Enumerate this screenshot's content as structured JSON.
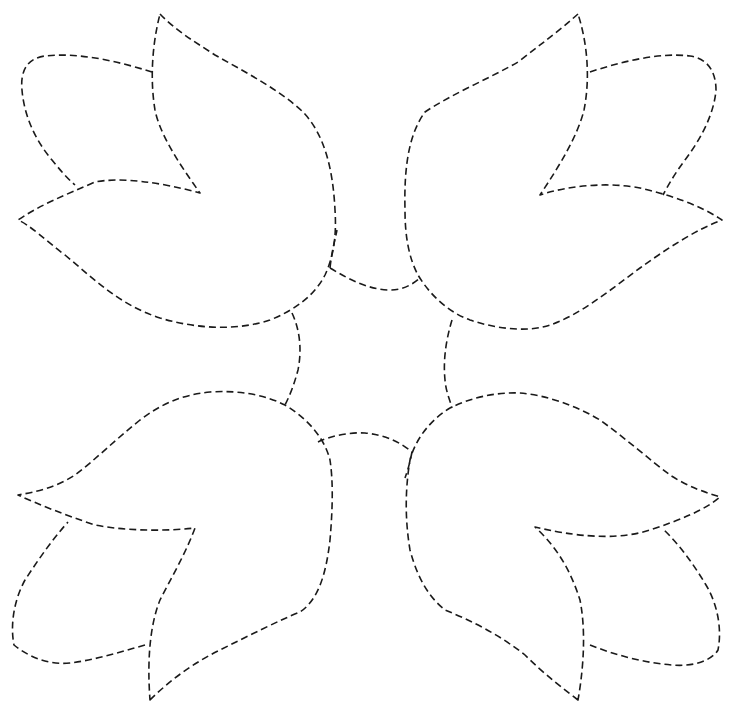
{
  "figure": {
    "stroke_color": "#1a1a1a",
    "background_color": "#ffffff",
    "line_style": "dashed"
  },
  "shapes": [
    {
      "name": "tulip-top-left-bloom",
      "d": "M160,14 C175,30 195,42 215,55 C245,72 280,90 303,112 C325,135 333,170 335,210 C337,240 332,260 325,275 C315,295 295,310 270,320 C240,330 200,330 160,318 C120,305 95,280 65,255 C45,240 30,225 18,220 C40,205 65,195 95,182 C120,177 160,182 200,193 C180,165 160,135 155,110 C150,80 152,45 160,14 Z"
    },
    {
      "name": "tulip-top-left-leaf",
      "d": "M152,72 C120,62 80,52 45,56 C28,58 20,70 22,90 C24,115 35,140 52,160 C60,170 67,178 75,185"
    },
    {
      "name": "tulip-top-right-bloom",
      "d": "M578,14 C560,30 540,45 518,62 C490,78 450,95 425,112 C408,135 404,170 405,210 C405,240 410,260 418,275 C430,295 448,312 470,320 C500,330 530,332 550,325 C580,315 610,290 640,268 C665,250 695,230 722,220 C700,205 670,195 640,188 C610,182 570,185 540,195 C560,165 578,135 584,110 C590,80 588,45 578,14 Z"
    },
    {
      "name": "tulip-top-right-leaf",
      "d": "M590,72 C620,62 660,52 690,56 C706,58 716,70 716,90 C714,115 700,140 685,160 C676,172 670,182 663,195"
    },
    {
      "name": "tulip-bottom-left-bloom",
      "d": "M150,700 C170,680 195,662 220,650 C250,635 280,620 300,612 C318,600 326,575 330,540 C333,505 333,480 330,460 C325,440 310,420 285,405 C265,395 240,390 210,392 C180,395 160,405 140,420 C115,440 95,460 75,475 C55,488 35,492 18,495 C40,505 65,515 95,525 C120,530 160,532 195,528 C185,555 170,580 160,600 C150,625 147,660 150,700 Z"
    },
    {
      "name": "tulip-bottom-left-leaf",
      "d": "M145,645 C120,652 95,660 70,663 C50,665 30,658 14,645 C10,625 14,600 25,580 C38,560 52,540 68,522"
    },
    {
      "name": "tulip-bottom-right-bloom",
      "d": "M578,700 C565,690 545,675 525,655 C500,635 470,620 445,610 C430,598 418,580 410,550 C405,520 405,490 410,460 C415,440 430,420 450,408 C470,398 495,392 520,393 C545,395 575,405 600,420 C625,438 650,460 670,475 C690,488 705,492 720,497 C705,510 680,520 650,530 C625,538 590,540 535,527 C560,550 572,575 580,600 C585,625 585,660 578,700 Z"
    },
    {
      "name": "tulip-bottom-right-leaf",
      "d": "M590,645 C615,655 645,663 672,665 C695,667 712,660 718,650 C722,630 718,605 706,585 C694,565 680,545 662,528"
    },
    {
      "name": "connector-arc-top",
      "d": "M330,268 C350,280 370,290 390,290 C402,290 412,285 420,278"
    },
    {
      "name": "connector-arc-left",
      "d": "M292,313 C300,330 302,350 298,370 C294,385 290,395 285,405"
    },
    {
      "name": "connector-arc-right",
      "d": "M452,320 C446,340 443,360 445,380 C446,392 450,400 452,408"
    },
    {
      "name": "connector-arc-bottom",
      "d": "M318,442 C330,436 350,432 365,433 C385,435 400,442 412,452"
    },
    {
      "name": "connector-stub-top",
      "d": "M330,268 C332,250 335,240 337,230"
    },
    {
      "name": "connector-stub-bottom",
      "d": "M412,452 C410,462 408,470 405,478"
    }
  ]
}
